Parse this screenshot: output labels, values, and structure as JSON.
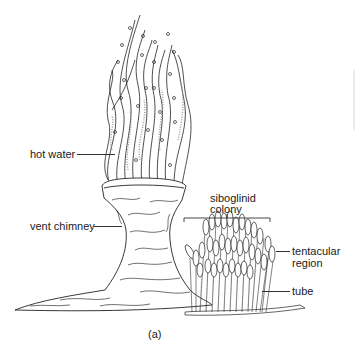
{
  "figure": {
    "panel_label": "(a)",
    "labels": {
      "hot_water": "hot water",
      "vent_chimney": "vent chimney",
      "colony_line1": "siboglinid",
      "colony_line2": "colony",
      "tentacular_line1": "tentacular",
      "tentacular_line2": "region",
      "tube": "tube"
    },
    "colors": {
      "ink": "#1a1a1a",
      "stipple": "#8a8a8a",
      "background": "#ffffff"
    }
  }
}
